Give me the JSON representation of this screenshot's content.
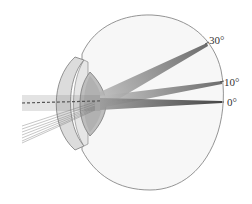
{
  "diagram": {
    "type": "eye-cross-section",
    "angle_labels": [
      {
        "id": "angle-30",
        "text": "30°",
        "x": 209,
        "y": 35
      },
      {
        "id": "angle-10",
        "text": "10°",
        "x": 224,
        "y": 77
      },
      {
        "id": "angle-0",
        "text": "0°",
        "x": 227,
        "y": 97
      }
    ],
    "parts": [
      "eyeball",
      "cornea",
      "lens",
      "light-rays",
      "retina"
    ],
    "colors": {
      "outline": "#7a7a7a",
      "eyeball_fill": "#f7f7f7",
      "cornea_fill": "#dcdcdc",
      "lens_fill": "#bdbdbd",
      "ray": "#6e6e6e",
      "label": "#333333"
    }
  }
}
